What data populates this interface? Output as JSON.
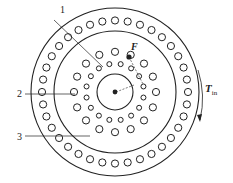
{
  "diagram": {
    "labels": {
      "l1": "1",
      "l2": "2",
      "l3": "3",
      "force": "F",
      "torque": "T",
      "torque_sub": "in"
    },
    "geometry": {
      "center": [
        115,
        92
      ],
      "outer_ring_radius": 84,
      "inner_ring_radius": 61,
      "hub_radius": 18,
      "outer_hole_count": 36,
      "outer_hole_orbit": 73,
      "mid_large_hole_count": 16,
      "mid_large_hole_orbit": 41,
      "mid_small_hole_count": 16,
      "mid_small_hole_orbit": 29
    },
    "colors": {
      "stroke": "#222222",
      "background": "#ffffff"
    }
  }
}
